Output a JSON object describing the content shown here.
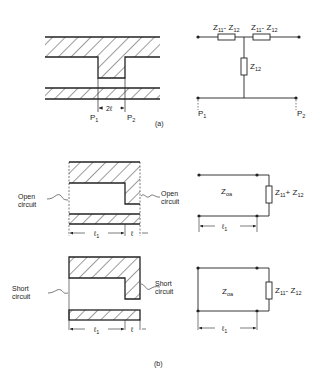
{
  "figure": {
    "panel_a": {
      "caption": "(a)",
      "waveguide": {
        "port1_label": "P",
        "port1_sub": "1",
        "port2_label": "P",
        "port2_sub": "2",
        "gap_label": "2ℓ"
      },
      "circuit": {
        "series_left_label": "Z",
        "series_left_sub1": "11",
        "series_left_mid": "- Z",
        "series_left_sub2": "12",
        "series_right_label": "Z",
        "series_right_sub1": "11",
        "series_right_mid": "- Z",
        "series_right_sub2": "12",
        "shunt_label": "Z",
        "shunt_sub": "12",
        "port1_label": "P",
        "port1_sub": "1",
        "port2_label": "P",
        "port2_sub": "2"
      }
    },
    "panel_b": {
      "caption": "(b)",
      "open": {
        "left_label_line1": "Open",
        "left_label_line2": "circuit",
        "right_label_line1": "Open",
        "right_label_line2": "circuit",
        "len1_label": "ℓ",
        "len1_sub": "1",
        "len2_label": "ℓ",
        "line_label": "Z",
        "line_sub": "oa",
        "load_label": "Z",
        "load_sub1": "11",
        "load_mid": "+ Z",
        "load_sub2": "12",
        "circuit_len_label": "ℓ",
        "circuit_len_sub": "1"
      },
      "short": {
        "left_label_line1": "Short",
        "left_label_line2": "circuit",
        "right_label_line1": "Short",
        "right_label_line2": "circuit",
        "len1_label": "ℓ",
        "len1_sub": "1",
        "len2_label": "ℓ",
        "line_label": "Z",
        "line_sub": "oa",
        "load_label": "Z",
        "load_sub1": "11",
        "load_mid": "- Z",
        "load_sub2": "12",
        "circuit_len_label": "ℓ",
        "circuit_len_sub": "1"
      }
    }
  }
}
